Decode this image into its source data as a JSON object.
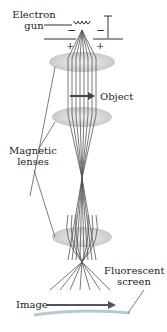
{
  "diagram": {
    "labels": {
      "electron_gun_line1": "Electron",
      "electron_gun_line2": "gun",
      "object": "Object",
      "magnetic_lenses_line1": "Magnetic",
      "magnetic_lenses_line2": "lenses",
      "fluorescent_screen_line1": "Fluorescent",
      "fluorescent_screen_line2": "screen",
      "image": "Image"
    },
    "polarity": {
      "top_left": "−",
      "top_right": "−",
      "bottom_left": "+",
      "bottom_right": "+"
    },
    "colors": {
      "lens": "#d8d8d8",
      "beam": "#555555",
      "arrow": "#555555",
      "text": "#222222",
      "screen": "#b8c8d0"
    }
  }
}
